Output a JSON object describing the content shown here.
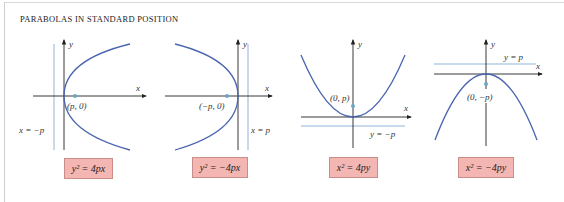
{
  "title": "PARABOLAS IN STANDARD POSITION",
  "colors": {
    "curve": "#4a64b0",
    "directrix": "#8fb4d6",
    "axis": "#222222",
    "focus": "#6aa8c8",
    "box_fill": "#f4b6b2",
    "box_border": "#c98e8a"
  },
  "panels": [
    {
      "equation": "y² = 4px",
      "x_axis_label": "x",
      "y_axis_label": "y",
      "focus_label": "(p, 0)",
      "directrix_label": "x = −p",
      "opens": "right"
    },
    {
      "equation": "y² = −4px",
      "x_axis_label": "x",
      "y_axis_label": "y",
      "focus_label": "(−p, 0)",
      "directrix_label": "x = p",
      "opens": "left"
    },
    {
      "equation": "x² = 4py",
      "x_axis_label": "x",
      "y_axis_label": "y",
      "focus_label": "(0, p)",
      "directrix_label": "y = −p",
      "opens": "up"
    },
    {
      "equation": "x² = −4py",
      "x_axis_label": "x",
      "y_axis_label": "y",
      "focus_label": "(0, −p)",
      "directrix_label": "y = p",
      "opens": "down"
    }
  ]
}
